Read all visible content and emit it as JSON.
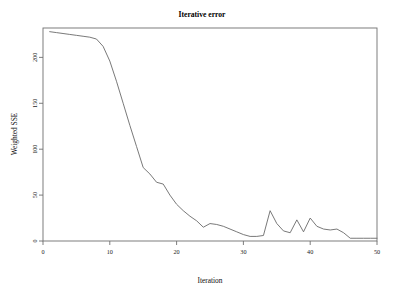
{
  "chart_data": {
    "type": "line",
    "title": "Iterative error",
    "xlabel": "Iteration",
    "ylabel": "Weighted SSE",
    "xlim": [
      0,
      50
    ],
    "ylim": [
      0,
      232
    ],
    "xticks": [
      0,
      10,
      20,
      30,
      40,
      50
    ],
    "xtick_labels": [
      "0",
      "10",
      "20",
      "30",
      "40",
      "50"
    ],
    "yticks": [
      0,
      50,
      100,
      150,
      200
    ],
    "ytick_labels": [
      "0",
      "50",
      "100",
      "150",
      "200"
    ],
    "grid": false,
    "legend": false,
    "legend_position": "none",
    "line_color": "#6a6a6a",
    "frame_color": "#6f6f6f",
    "background_color": "#ffffff",
    "series": [
      {
        "name": "Weighted SSE",
        "x": [
          1,
          2,
          3,
          4,
          5,
          6,
          7,
          8,
          9,
          10,
          11,
          12,
          13,
          14,
          15,
          16,
          17,
          18,
          19,
          20,
          21,
          22,
          23,
          24,
          25,
          26,
          27,
          28,
          29,
          30,
          31,
          32,
          33,
          34,
          35,
          36,
          37,
          38,
          39,
          40,
          41,
          42,
          43,
          44,
          45,
          46,
          47,
          48,
          49,
          50
        ],
        "values": [
          228,
          227,
          226,
          225,
          224,
          223,
          222,
          220,
          212,
          196,
          174,
          150,
          126,
          103,
          80,
          73,
          64,
          62,
          50,
          40,
          33,
          27,
          22,
          15,
          19,
          18,
          16,
          13,
          10,
          7,
          5,
          5,
          6,
          33,
          19,
          11,
          9,
          23,
          10,
          25,
          16,
          13,
          12,
          13,
          9,
          3,
          3,
          3,
          3,
          3
        ]
      }
    ]
  },
  "axes": {
    "y_axis_title": "Weighted SSE",
    "x_axis_title": "Iteration"
  },
  "title": {
    "text": "Iterative error"
  }
}
